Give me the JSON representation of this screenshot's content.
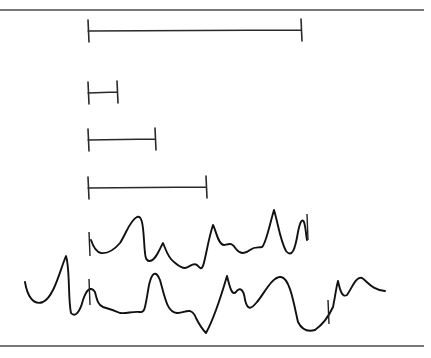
{
  "figure": {
    "width": 431,
    "height": 358,
    "background": "#ffffff",
    "ink_color": "#111111",
    "rules": {
      "top": {
        "y": 10,
        "x1": 0,
        "x2": 424
      },
      "bottom": {
        "y": 346,
        "x1": 0,
        "x2": 424
      }
    },
    "scale_bars": [
      {
        "id": "bar-1",
        "x1": 88,
        "x2": 301,
        "y": 31
      },
      {
        "id": "bar-2",
        "x1": 88,
        "x2": 117,
        "y": 93
      },
      {
        "id": "bar-3",
        "x1": 88,
        "x2": 155,
        "y": 140
      },
      {
        "id": "bar-4",
        "x1": 88,
        "x2": 206,
        "y": 188
      }
    ],
    "waveforms": [
      {
        "id": "upper-trace",
        "onset_marker_x": 89,
        "path": "M 91 240 C 93 246, 96 252, 101 253 C 108 254, 114 250, 120 243 C 126 234, 130 220, 137 217 C 142 215, 143 225, 144 240 C 145 255, 145 262, 150 261 C 156 260, 159 250, 163 243 C 166 250, 168 258, 174 262 C 179 266, 181 268, 185 268 C 190 267, 193 262, 197 265 C 200 268, 201 270, 203 266 C 206 257, 208 240, 213 225 C 216 230, 218 245, 224 245 C 229 244, 232 242, 236 249 C 240 254, 245 254, 250 250 C 255 246, 258 248, 262 247 C 266 244, 270 223, 274 210 C 278 223, 280 240, 286 251 C 292 258, 295 250, 298 232 C 300 222, 302 218, 304 222 C 306 228, 306 236, 307 240"
      },
      {
        "id": "lower-trace",
        "onset_marker_x": 89,
        "offset_marker_x": 328,
        "path": "M 25 282 C 27 295, 33 306, 43 302 C 54 297, 60 270, 66 256 C 70 268, 68 300, 71 313 C 75 318, 80 312, 83 300 C 86 291, 90 285, 95 292 C 97 300, 98 305, 103 307 C 110 309, 113 310, 120 313 C 127 314, 132 311, 140 312 C 145 313, 145 308, 149 285 C 152 272, 156 270, 160 280 C 165 298, 167 312, 177 313 C 184 314, 191 305, 196 318 C 200 326, 203 330, 206 333 C 212 322, 220 300, 227 276 C 230 288, 232 296, 236 292 C 240 286, 244 290, 245 300 C 248 312, 252 308, 257 302 C 264 294, 272 276, 281 277 C 290 278, 294 305, 298 322 C 302 330, 308 332, 315 330 C 322 325, 328 318, 333 307 C 335 298, 336 288, 338 281 C 340 290, 342 298, 347 295 C 352 288, 356 276, 362 278 C 368 282, 372 290, 385 291"
      }
    ],
    "markers": [
      {
        "id": "upper-onset-tick",
        "x": 89,
        "y1": 232,
        "y2": 256
      },
      {
        "id": "lower-onset-tick",
        "x": 89,
        "y1": 279,
        "y2": 305
      },
      {
        "id": "lower-offset-tick",
        "x": 328,
        "y1": 300,
        "y2": 324
      },
      {
        "id": "upper-end-tick",
        "x": 307,
        "y1": 214,
        "y2": 240
      }
    ]
  }
}
